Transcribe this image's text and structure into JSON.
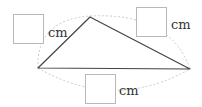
{
  "diagram": {
    "type": "triangle-measurement",
    "colors": {
      "triangle_stroke": "#444444",
      "dashed_arc": "#bbbbbb",
      "box_border": "#b8b8b8",
      "text": "#333333"
    },
    "vertices": {
      "left": [
        38,
        68
      ],
      "top": [
        90,
        17
      ],
      "right": [
        190,
        69
      ]
    },
    "answer_boxes": [
      {
        "side": "left-top",
        "unit": "cm",
        "value": ""
      },
      {
        "side": "top-right",
        "unit": "cm",
        "value": ""
      },
      {
        "side": "bottom",
        "unit": "cm",
        "value": ""
      }
    ]
  }
}
